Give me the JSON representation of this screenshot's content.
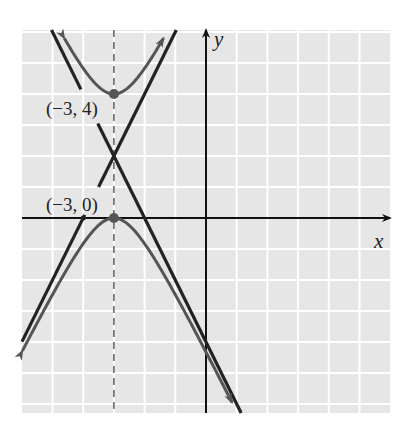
{
  "chart_data": {
    "type": "line",
    "title": "",
    "xlabel": "x",
    "ylabel": "y",
    "xlim": [
      -6,
      6
    ],
    "ylim": [
      -6.3,
      6.1
    ],
    "grid": true,
    "series": [
      {
        "name": "hyperbola",
        "equation": "(y-2)^2/4 - (x+3)^2 = 1",
        "kind": "hyperbola",
        "center": [
          -3,
          2
        ],
        "a": 2,
        "b": 1,
        "orientation": "vertical",
        "color": "#555555"
      },
      {
        "name": "asymptote-1",
        "equation": "y = 2x + 8",
        "kind": "line",
        "slope": 2,
        "intercept": 8,
        "color": "#222222"
      },
      {
        "name": "asymptote-2",
        "equation": "y = -2x - 4",
        "kind": "line",
        "slope": -2,
        "intercept": -4,
        "color": "#222222"
      },
      {
        "name": "axis-of-symmetry",
        "equation": "x = -3",
        "kind": "vertical-dashed",
        "x": -3,
        "color": "#444444"
      }
    ],
    "points": [
      {
        "label": "(−3, 4)",
        "x": -3,
        "y": 4
      },
      {
        "label": "(−3, 0)",
        "x": -3,
        "y": 0
      }
    ],
    "annotations": [
      {
        "text": "(−3, 4)",
        "x": -3,
        "y": 4
      },
      {
        "text": "(−3, 0)",
        "x": -3,
        "y": 0
      }
    ]
  },
  "labels": {
    "x_axis": "x",
    "y_axis": "y",
    "vertex_top": "(−3, 4)",
    "vertex_bottom": "(−3, 0)"
  },
  "colors": {
    "grid_bg": "#e6e6e6",
    "grid_line": "#ffffff",
    "axis": "#111111",
    "curve": "#555555",
    "asymptote": "#222222"
  }
}
